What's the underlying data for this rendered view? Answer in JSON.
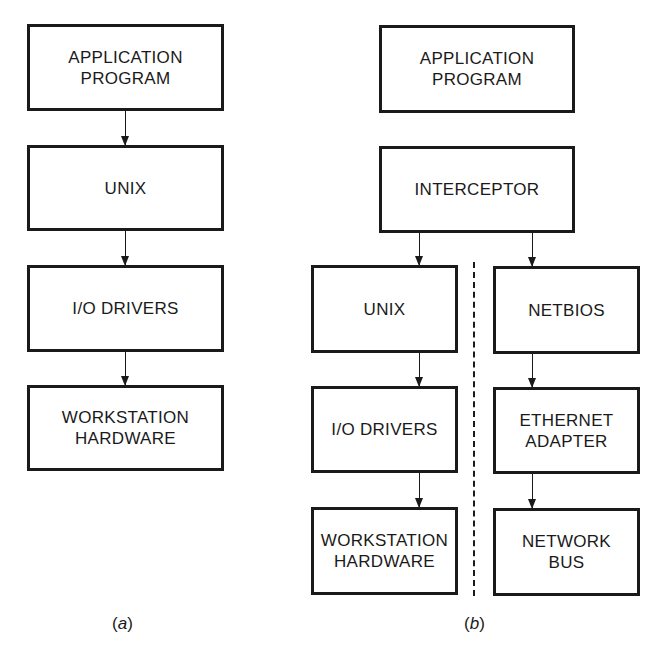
{
  "figure": {
    "panel_a": {
      "caption": "(a)",
      "boxes": [
        {
          "label": "APPLICATION\nPROGRAM"
        },
        {
          "label": "UNIX"
        },
        {
          "label": "I/O DRIVERS"
        },
        {
          "label": "WORKSTATION\nHARDWARE"
        }
      ]
    },
    "panel_b": {
      "caption": "(b)",
      "top_boxes": [
        {
          "label": "APPLICATION\nPROGRAM"
        },
        {
          "label": "INTERCEPTOR"
        }
      ],
      "left_column": [
        {
          "label": "UNIX"
        },
        {
          "label": "I/O DRIVERS"
        },
        {
          "label": "WORKSTATION\nHARDWARE"
        }
      ],
      "right_column": [
        {
          "label": "NETBIOS"
        },
        {
          "label": "ETHERNET\nADAPTER"
        },
        {
          "label": "NETWORK\nBUS"
        }
      ]
    }
  }
}
